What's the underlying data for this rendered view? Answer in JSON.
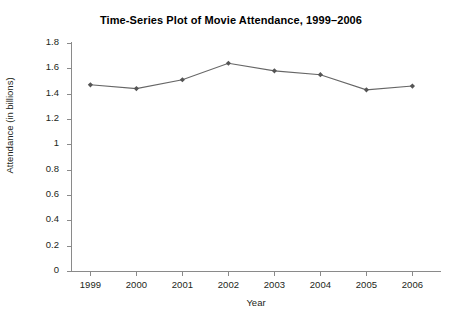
{
  "chart_data": {
    "type": "line",
    "title": "Time-Series Plot of Movie Attendance, 1999–2006",
    "xlabel": "Year",
    "ylabel": "Attendance (in billions)",
    "categories": [
      "1999",
      "2000",
      "2001",
      "2002",
      "2003",
      "2004",
      "2005",
      "2006"
    ],
    "x": [
      1999,
      2000,
      2001,
      2002,
      2003,
      2004,
      2005,
      2006
    ],
    "values": [
      1.47,
      1.44,
      1.51,
      1.64,
      1.58,
      1.55,
      1.43,
      1.46
    ],
    "series": [
      {
        "name": "Movie attendance",
        "values": [
          1.47,
          1.44,
          1.51,
          1.64,
          1.58,
          1.55,
          1.43,
          1.46
        ]
      }
    ],
    "ylim": [
      0,
      1.8
    ],
    "ytick_labels": [
      "0",
      "0.2",
      "0.4",
      "0.6",
      "0.8",
      "1",
      "1.2",
      "1.4",
      "1.6",
      "1.8"
    ],
    "ytick_values": [
      0,
      0.2,
      0.4,
      0.6,
      0.8,
      1.0,
      1.2,
      1.4,
      1.6,
      1.8
    ],
    "xlim": [
      1998.6,
      2006.6
    ],
    "grid": false,
    "legend": false,
    "legend_position": "none",
    "line_color": "#666666",
    "marker": "diamond",
    "marker_color": "#555555",
    "axis_color": "#8a8a8a",
    "background_color": "#ffffff"
  }
}
